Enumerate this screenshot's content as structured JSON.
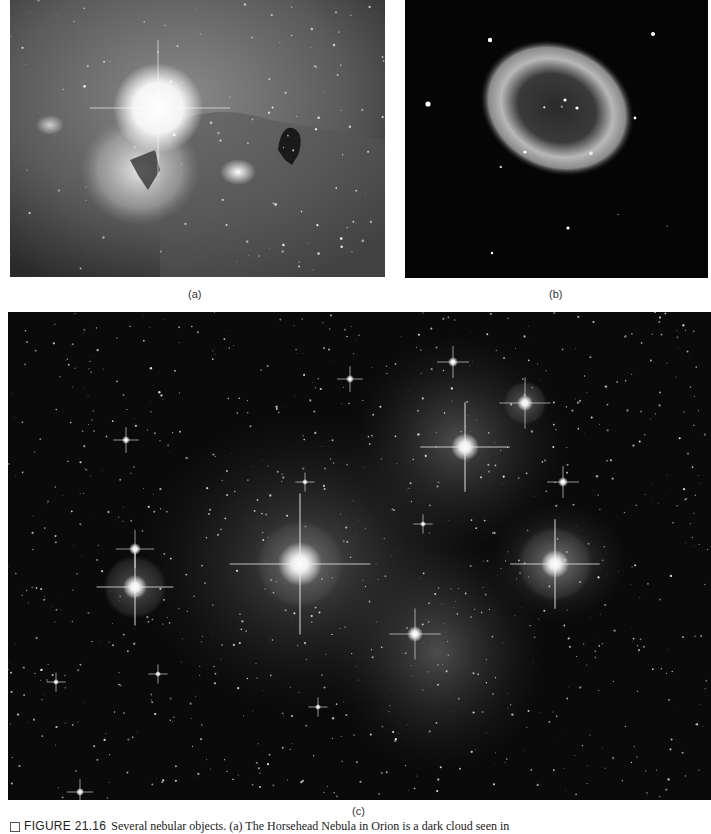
{
  "figure": {
    "panels": [
      {
        "id": "a",
        "label": "(a)",
        "subject": "Horsehead Nebula and Flame Nebula in Orion"
      },
      {
        "id": "b",
        "label": "(b)",
        "subject": "Ring Nebula"
      },
      {
        "id": "c",
        "label": "(c)",
        "subject": "Pleiades star cluster with reflection nebulosity"
      }
    ],
    "caption": {
      "figure_number": "FIGURE 21.16",
      "text": "Several nebular objects. (a) The Horsehead Nebula in Orion is a dark cloud seen in"
    }
  }
}
